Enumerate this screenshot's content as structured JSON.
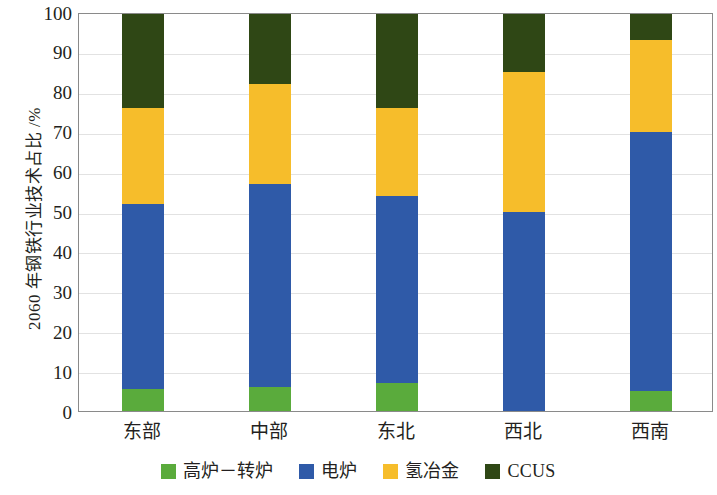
{
  "chart_data": {
    "type": "bar",
    "subtype": "stacked-bar-100",
    "title": "",
    "xlabel": "",
    "ylabel": "2060 年钢铁行业技术占比 /%",
    "ylim": [
      0,
      100
    ],
    "yticks": [
      0,
      10,
      20,
      30,
      40,
      50,
      60,
      70,
      80,
      90,
      100
    ],
    "ytick_labels": [
      "0",
      "10",
      "20",
      "30",
      "40",
      "50",
      "60",
      "70",
      "80",
      "90",
      "100"
    ],
    "grid": true,
    "legend_position": "bottom",
    "categories": [
      "东部",
      "中部",
      "东北",
      "西北",
      "西南"
    ],
    "series": [
      {
        "name": "高炉－转炉",
        "color": "#5aab3c",
        "values": [
          5.5,
          6,
          7,
          0,
          5
        ]
      },
      {
        "name": "电炉",
        "color": "#2f5aa8",
        "values": [
          46.5,
          51,
          47,
          50,
          65
        ]
      },
      {
        "name": "氢冶金",
        "color": "#f6bd2b",
        "values": [
          24,
          25,
          22,
          35,
          23
        ]
      },
      {
        "name": "CCUS",
        "color": "#2f4715",
        "values": [
          24,
          18,
          24,
          15,
          7
        ]
      }
    ],
    "cumulative_tops": [
      [
        5.5,
        52,
        76,
        100
      ],
      [
        6,
        57,
        82,
        100
      ],
      [
        7,
        54,
        76,
        100
      ],
      [
        0,
        50,
        85,
        100
      ],
      [
        5,
        70,
        93,
        100
      ]
    ]
  },
  "legend": {
    "items": [
      {
        "label": "高炉－转炉",
        "color": "#5aab3c",
        "script": "cjk"
      },
      {
        "label": "电炉",
        "color": "#2f5aa8",
        "script": "cjk"
      },
      {
        "label": "氢冶金",
        "color": "#f6bd2b",
        "script": "cjk"
      },
      {
        "label": "CCUS",
        "color": "#2f4715",
        "script": "latin"
      }
    ]
  },
  "axes": {
    "y_title": "2060 年钢铁行业技术占比 /%",
    "frame_color": "#8a8a8a",
    "grid_color": "#e2e2e2"
  }
}
